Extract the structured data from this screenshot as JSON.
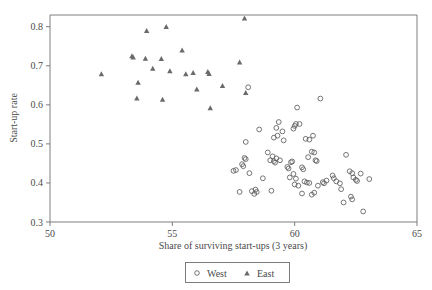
{
  "chart_data": {
    "type": "scatter",
    "title": "",
    "xlabel": "Share of surviving start-ups (3 years)",
    "ylabel": "Start-up rate",
    "xlim": [
      50,
      65
    ],
    "ylim": [
      0.3,
      0.83
    ],
    "xticks": [
      50,
      55,
      60,
      65
    ],
    "xticklabels": [
      "50",
      "55",
      "60",
      "65"
    ],
    "yticks": [
      0.3,
      0.4,
      0.5,
      0.6,
      0.7,
      0.8
    ],
    "yticklabels": [
      "0.3",
      "0.4",
      "0.5",
      "0.6",
      "0.7",
      "0.8"
    ],
    "grid": false,
    "legend_position": "below-axis-center",
    "series": [
      {
        "name": "West",
        "marker": "open-circle",
        "color": "#5d5d5d",
        "points": [
          [
            58.1,
            0.645
          ],
          [
            58.55,
            0.537
          ],
          [
            58.0,
            0.505
          ],
          [
            59.35,
            0.556
          ],
          [
            59.25,
            0.541
          ],
          [
            59.3,
            0.521
          ],
          [
            59.15,
            0.516
          ],
          [
            59.5,
            0.532
          ],
          [
            59.55,
            0.509
          ],
          [
            60.1,
            0.593
          ],
          [
            60.05,
            0.551
          ],
          [
            60.2,
            0.551
          ],
          [
            60.0,
            0.546
          ],
          [
            59.95,
            0.539
          ],
          [
            60.45,
            0.513
          ],
          [
            60.75,
            0.521
          ],
          [
            60.6,
            0.511
          ],
          [
            61.05,
            0.616
          ],
          [
            57.5,
            0.431
          ],
          [
            57.6,
            0.433
          ],
          [
            57.85,
            0.448
          ],
          [
            57.9,
            0.443
          ],
          [
            57.95,
            0.464
          ],
          [
            58.0,
            0.461
          ],
          [
            58.15,
            0.425
          ],
          [
            57.75,
            0.377
          ],
          [
            58.25,
            0.379
          ],
          [
            58.35,
            0.372
          ],
          [
            58.4,
            0.383
          ],
          [
            58.45,
            0.377
          ],
          [
            58.7,
            0.412
          ],
          [
            58.9,
            0.478
          ],
          [
            59.1,
            0.468
          ],
          [
            59.0,
            0.458
          ],
          [
            59.15,
            0.456
          ],
          [
            59.25,
            0.463
          ],
          [
            59.2,
            0.452
          ],
          [
            59.4,
            0.458
          ],
          [
            59.05,
            0.38
          ],
          [
            59.7,
            0.441
          ],
          [
            59.75,
            0.437
          ],
          [
            59.85,
            0.453
          ],
          [
            59.9,
            0.455
          ],
          [
            59.95,
            0.423
          ],
          [
            59.8,
            0.414
          ],
          [
            60.05,
            0.411
          ],
          [
            60.0,
            0.396
          ],
          [
            60.15,
            0.393
          ],
          [
            60.3,
            0.44
          ],
          [
            60.35,
            0.435
          ],
          [
            60.55,
            0.466
          ],
          [
            60.7,
            0.48
          ],
          [
            60.8,
            0.478
          ],
          [
            60.85,
            0.458
          ],
          [
            60.9,
            0.456
          ],
          [
            60.4,
            0.404
          ],
          [
            60.5,
            0.401
          ],
          [
            60.6,
            0.4
          ],
          [
            60.3,
            0.373
          ],
          [
            60.7,
            0.37
          ],
          [
            60.8,
            0.375
          ],
          [
            60.95,
            0.393
          ],
          [
            61.15,
            0.402
          ],
          [
            61.2,
            0.399
          ],
          [
            61.3,
            0.406
          ],
          [
            61.55,
            0.419
          ],
          [
            61.6,
            0.412
          ],
          [
            61.7,
            0.404
          ],
          [
            61.85,
            0.399
          ],
          [
            61.9,
            0.384
          ],
          [
            62.0,
            0.35
          ],
          [
            62.1,
            0.472
          ],
          [
            62.25,
            0.43
          ],
          [
            62.35,
            0.425
          ],
          [
            62.4,
            0.414
          ],
          [
            62.5,
            0.408
          ],
          [
            62.55,
            0.405
          ],
          [
            62.7,
            0.424
          ],
          [
            62.3,
            0.365
          ],
          [
            62.35,
            0.358
          ],
          [
            62.8,
            0.327
          ],
          [
            63.05,
            0.41
          ]
        ]
      },
      {
        "name": "East",
        "marker": "filled-triangle",
        "color": "#6a6a6a",
        "points": [
          [
            52.1,
            0.678
          ],
          [
            53.35,
            0.724
          ],
          [
            53.4,
            0.721
          ],
          [
            53.9,
            0.718
          ],
          [
            53.95,
            0.789
          ],
          [
            53.6,
            0.656
          ],
          [
            53.55,
            0.616
          ],
          [
            54.2,
            0.692
          ],
          [
            54.55,
            0.717
          ],
          [
            54.75,
            0.799
          ],
          [
            54.6,
            0.613
          ],
          [
            54.9,
            0.686
          ],
          [
            55.4,
            0.739
          ],
          [
            55.55,
            0.678
          ],
          [
            55.85,
            0.681
          ],
          [
            56.0,
            0.639
          ],
          [
            56.45,
            0.684
          ],
          [
            56.5,
            0.679
          ],
          [
            56.55,
            0.591
          ],
          [
            57.05,
            0.648
          ],
          [
            57.75,
            0.708
          ],
          [
            57.95,
            0.821
          ],
          [
            58.0,
            0.63
          ]
        ]
      }
    ]
  },
  "axes": {
    "x_title": "Share of surviving start-ups (3 years)",
    "y_title": "Start-up rate"
  },
  "legend": {
    "entries": [
      {
        "label": "West",
        "marker": "open-circle"
      },
      {
        "label": "East",
        "marker": "filled-triangle"
      }
    ]
  },
  "colors": {
    "frame": "#6f6f6f",
    "text": "#4a4a4a",
    "west_marker": "#5d5d5d",
    "east_marker": "#6a6a6a",
    "background": "#ffffff"
  }
}
